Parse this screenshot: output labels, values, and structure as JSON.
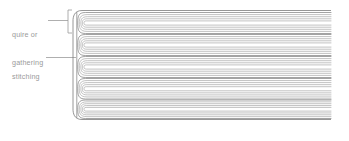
{
  "figure": {
    "type": "diagram",
    "background_color": "#ffffff",
    "width": 349,
    "height": 141
  },
  "labels": {
    "quire": {
      "line1": "quire or",
      "line2": "gathering",
      "color": "#9a9a9a",
      "x": 12,
      "y": 11,
      "leader": {
        "x1": 48,
        "y1": 20.5,
        "x2": 68,
        "y2": 20.5
      },
      "bracket": {
        "x": 68,
        "y_top": 10,
        "y_bottom": 33,
        "tick": 4
      }
    },
    "stitching": {
      "line1": "stitching",
      "color": "#9a9a9a",
      "x": 12,
      "y": 53,
      "leader": {
        "x1": 46,
        "y1": 57.5,
        "x2": 76,
        "y2": 57.5
      }
    }
  },
  "diagram": {
    "stroke_color": "#7b7b7b",
    "stroke_color_light": "#a8a8a8",
    "stroke_width": 0.7,
    "spine_x": 77,
    "right_edge_x": 331,
    "top_y": 12,
    "bottom_y": 118,
    "quire_count": 5,
    "sheets_per_quire": 5,
    "quires": [
      {
        "index": 1,
        "top": 12.5,
        "bottom": 33.5
      },
      {
        "index": 2,
        "top": 34.5,
        "bottom": 55.5
      },
      {
        "index": 3,
        "top": 56.5,
        "bottom": 77.5
      },
      {
        "index": 4,
        "top": 78.5,
        "bottom": 99.0
      },
      {
        "index": 5,
        "top": 100.0,
        "bottom": 118.5
      }
    ]
  }
}
